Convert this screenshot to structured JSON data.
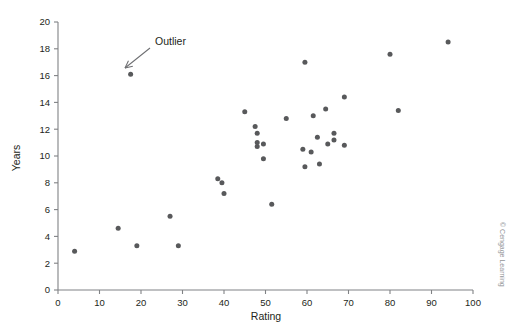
{
  "chart_data": {
    "type": "scatter",
    "title": "",
    "xlabel": "Rating",
    "ylabel": "Years",
    "xlim": [
      0,
      100
    ],
    "ylim": [
      0,
      20
    ],
    "xticks": [
      0,
      10,
      20,
      30,
      40,
      50,
      60,
      70,
      80,
      90,
      100
    ],
    "yticks": [
      0,
      2,
      4,
      6,
      8,
      10,
      12,
      14,
      16,
      18,
      20
    ],
    "grid": false,
    "legend": null,
    "point_color": "#58595b",
    "axis_color": "#808285",
    "points": [
      {
        "x": 4.0,
        "y": 2.9
      },
      {
        "x": 14.5,
        "y": 4.6
      },
      {
        "x": 19.0,
        "y": 3.3
      },
      {
        "x": 17.5,
        "y": 16.1
      },
      {
        "x": 27.0,
        "y": 5.5
      },
      {
        "x": 29.0,
        "y": 3.3
      },
      {
        "x": 38.5,
        "y": 8.3
      },
      {
        "x": 39.5,
        "y": 8.0
      },
      {
        "x": 40.0,
        "y": 7.2
      },
      {
        "x": 45.0,
        "y": 13.3
      },
      {
        "x": 47.5,
        "y": 12.2
      },
      {
        "x": 48.0,
        "y": 11.7
      },
      {
        "x": 48.0,
        "y": 11.0
      },
      {
        "x": 48.0,
        "y": 10.7
      },
      {
        "x": 49.5,
        "y": 10.9
      },
      {
        "x": 49.5,
        "y": 9.8
      },
      {
        "x": 51.5,
        "y": 6.4
      },
      {
        "x": 55.0,
        "y": 12.8
      },
      {
        "x": 59.5,
        "y": 17.0
      },
      {
        "x": 59.0,
        "y": 10.5
      },
      {
        "x": 59.5,
        "y": 9.2
      },
      {
        "x": 61.0,
        "y": 10.3
      },
      {
        "x": 61.5,
        "y": 13.0
      },
      {
        "x": 62.5,
        "y": 11.4
      },
      {
        "x": 63.0,
        "y": 9.4
      },
      {
        "x": 64.5,
        "y": 13.5
      },
      {
        "x": 65.0,
        "y": 10.9
      },
      {
        "x": 66.5,
        "y": 11.7
      },
      {
        "x": 66.5,
        "y": 11.2
      },
      {
        "x": 69.0,
        "y": 14.4
      },
      {
        "x": 69.0,
        "y": 10.8
      },
      {
        "x": 80.0,
        "y": 17.6
      },
      {
        "x": 82.0,
        "y": 13.4
      },
      {
        "x": 94.0,
        "y": 18.5
      }
    ],
    "annotations": [
      {
        "label": "Outlier",
        "text_x": 155,
        "text_y": 45,
        "arrow_from_x": 150,
        "arrow_from_y": 48,
        "arrow_to_x": 125,
        "arrow_to_y": 68
      }
    ]
  },
  "credit": {
    "text": "© Cengage Learning"
  }
}
